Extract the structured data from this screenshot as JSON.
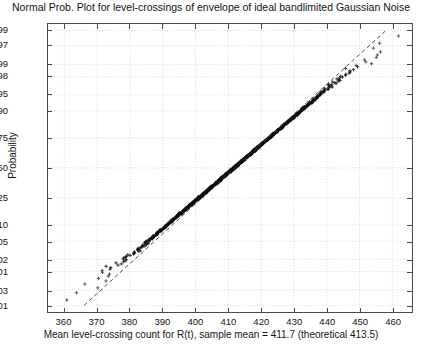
{
  "chart_data": {
    "type": "scatter",
    "title": "Normal Prob. Plot for level-crossings of envelope of ideal bandlimited Gaussian Noise",
    "xlabel": "Mean level-crossing count for R(t), sample mean = 411.7 (theoretical 413.5)",
    "ylabel": "Probability",
    "sample_mean": 411.7,
    "theoretical_mean": 413.5,
    "grid": true,
    "legend": "none",
    "marker": "+",
    "marker_color": "#101010",
    "reference_line": {
      "style": "dashed",
      "color": "#3a3a3a",
      "x_points": [
        366.0,
        458.0
      ],
      "p_points": [
        0.001,
        0.999
      ]
    },
    "xlim": [
      355.0,
      466.0
    ],
    "ylim_probability": [
      0.0006,
      0.9994
    ],
    "xticks": [
      360,
      370,
      380,
      390,
      400,
      410,
      420,
      430,
      440,
      450,
      460
    ],
    "xtick_labels": [
      "360",
      "370",
      "380",
      "390",
      "400",
      "410",
      "420",
      "430",
      "440",
      "450",
      "460"
    ],
    "yticks": [
      0.001,
      0.003,
      0.01,
      0.02,
      0.05,
      0.1,
      0.25,
      0.5,
      0.75,
      0.9,
      0.95,
      0.98,
      0.99,
      0.997,
      0.999
    ],
    "ytick_labels": [
      "0.001",
      "0.003",
      "0.01",
      "0.02",
      "0.05",
      "0.10",
      "0.25",
      "0.50",
      "0.75",
      "0.90",
      "0.95",
      "0.98",
      "0.99",
      "0.997",
      "0.999"
    ],
    "n_points": 1000,
    "distribution_fit": {
      "center_x": 411.7,
      "sigma_x": 15.9,
      "tail_spread_low": 5.0,
      "tail_spread_high": 5.5
    }
  }
}
